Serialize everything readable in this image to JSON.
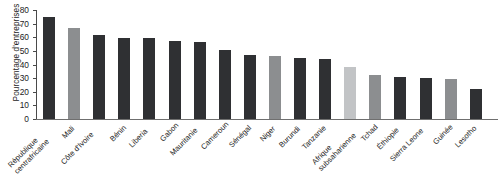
{
  "chart_data": {
    "type": "bar",
    "title": "",
    "xlabel": "",
    "ylabel": "Pourcentage d'entreprises",
    "ylim": [
      0,
      80
    ],
    "yticks": [
      0,
      10,
      20,
      30,
      40,
      50,
      60,
      70,
      80
    ],
    "grid": false,
    "legend": "none",
    "categories": [
      "République\ncentrafricaine",
      "Mali",
      "Côte d'Ivoire",
      "Bénin",
      "Liberia",
      "Gabon",
      "Mauritanie",
      "Cameroun",
      "Sénégal",
      "Niger",
      "Burundi",
      "Tanzanie",
      "Afrique\nsubsaharienne",
      "Tchad",
      "Éthiopie",
      "Sierra Leone",
      "Guinée",
      "Lesotho"
    ],
    "values": [
      75,
      67,
      62,
      59.5,
      59.5,
      57,
      56.5,
      50.5,
      47,
      46,
      45,
      44,
      38,
      32.5,
      31,
      30,
      29.5,
      22
    ],
    "bar_colors": [
      "#2f3033",
      "#8c8e90",
      "#2f3033",
      "#2f3033",
      "#2f3033",
      "#2f3033",
      "#2f3033",
      "#2f3033",
      "#2f3033",
      "#8c8e90",
      "#2f3033",
      "#2f3033",
      "#c2c4c6",
      "#8c8e90",
      "#2f3033",
      "#2f3033",
      "#8c8e90",
      "#2f3033"
    ]
  },
  "axis": {
    "tick_labels": [
      "0",
      "10",
      "20",
      "30",
      "40",
      "50",
      "60",
      "70",
      "80"
    ]
  }
}
